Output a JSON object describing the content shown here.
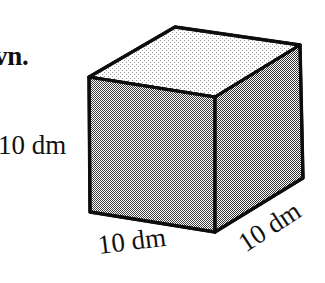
{
  "figure": {
    "name": "cube-diagram",
    "shape_type": "cube",
    "stroke_color": "#0d0d0d",
    "background_color": "#ffffff",
    "faces": {
      "top": {
        "name": "top-face",
        "fill_color": "#e6e6e6"
      },
      "front": {
        "name": "front-face",
        "fill_color": "#b5b5b5"
      },
      "right": {
        "name": "right-face",
        "fill_color": "#b0b0b0"
      }
    },
    "vertices": {
      "top_left": [
        89,
        77
      ],
      "top_apex": [
        175,
        27
      ],
      "top_right": [
        300,
        45
      ],
      "front_top_right": [
        215,
        97
      ],
      "bottom_left": [
        90,
        212
      ],
      "bottom_center": [
        215,
        232
      ],
      "bottom_right": [
        303,
        178
      ]
    }
  },
  "labels": {
    "partial_text": "vn.",
    "height": "10 dm",
    "width": "10 dm",
    "depth": "10 dm"
  }
}
